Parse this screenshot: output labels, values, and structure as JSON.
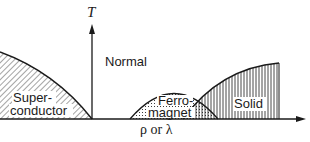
{
  "diagram": {
    "axes": {
      "y_label": "T",
      "x_label": "ρ or λ"
    },
    "regions": [
      {
        "id": "normal",
        "label": "Normal",
        "fill": "none"
      },
      {
        "id": "superconductor",
        "label_line1": "Super-",
        "label_line2": "conductor",
        "fill": "diagonal-hatch"
      },
      {
        "id": "ferromagnet",
        "label_line1": "Ferro-",
        "label_line2": "magnet",
        "fill": "dots"
      },
      {
        "id": "solid",
        "label": "Solid",
        "fill": "vertical-hatch"
      }
    ],
    "colors": {
      "ink": "#1a1a1a",
      "background": "#ffffff"
    }
  }
}
